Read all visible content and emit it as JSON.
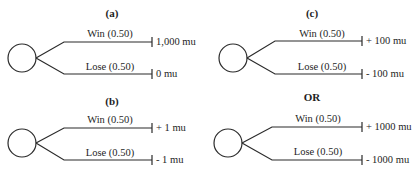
{
  "diagram": {
    "type": "decision-tree-gambles",
    "separator_label": "OR",
    "panels": [
      {
        "id": "a",
        "title": "(a)",
        "branches": [
          {
            "label": "Win",
            "probability": "(0.50)",
            "payoff": "1,000 mu"
          },
          {
            "label": "Lose",
            "probability": "(0.50)",
            "payoff": "0 mu"
          }
        ]
      },
      {
        "id": "b",
        "title": "(b)",
        "branches": [
          {
            "label": "Win",
            "probability": "(0.50)",
            "payoff": "+ 1 mu"
          },
          {
            "label": "Lose",
            "probability": "(0.50)",
            "payoff": "- 1 mu"
          }
        ]
      },
      {
        "id": "c",
        "title": "(c)",
        "branches": [
          {
            "label": "Win",
            "probability": "(0.50)",
            "payoff": "+ 100 mu"
          },
          {
            "label": "Lose",
            "probability": "(0.50)",
            "payoff": "- 100 mu"
          }
        ]
      },
      {
        "id": "c-alt",
        "title": "",
        "branches": [
          {
            "label": "Win",
            "probability": "(0.50)",
            "payoff": "+ 1000 mu"
          },
          {
            "label": "Lose",
            "probability": "(0.50)",
            "payoff": "- 1000 mu"
          }
        ]
      }
    ]
  },
  "text": {
    "a_title": "(a)",
    "b_title": "(b)",
    "c_title": "(c)",
    "or": "OR",
    "a_win": "Win  (0.50)",
    "a_lose": "Lose  (0.50)",
    "a_win_payoff": "1,000 mu",
    "a_lose_payoff": "0 mu",
    "b_win": "Win  (0.50)",
    "b_lose": "Lose  (0.50)",
    "b_win_payoff": "+ 1 mu",
    "b_lose_payoff": "- 1 mu",
    "c_win": "Win  (0.50)",
    "c_lose": "Lose  (0.50)",
    "c_win_payoff": "+ 100 mu",
    "c_lose_payoff": "- 100 mu",
    "d_win": "Win  (0.50)",
    "d_lose": "Lose  (0.50)",
    "d_win_payoff": "+ 1000 mu",
    "d_lose_payoff": "- 1000 mu"
  }
}
